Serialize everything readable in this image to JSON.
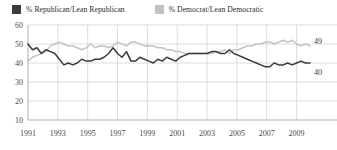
{
  "legend": {
    "position": "top-left",
    "entries": [
      {
        "label": "% Republican/Lean Republican",
        "color": "#3b3b3b",
        "swatch": "legend-swatch-republican"
      },
      {
        "label": "% Democrat/Lean Democratic",
        "color": "#c2c2c2",
        "swatch": "legend-swatch-democrat"
      }
    ]
  },
  "axes": {
    "y_ticks": [
      "60",
      "50",
      "40",
      "30",
      "20",
      "10"
    ],
    "x_ticks": [
      "1991",
      "1993",
      "1995",
      "1997",
      "1999",
      "2001",
      "2003",
      "2005",
      "2007",
      "2009"
    ]
  },
  "end_labels": {
    "democrat": "49",
    "republican": "40"
  },
  "colors": {
    "republican": "#3b3b3b",
    "democrat": "#c2c2c2",
    "grid": "#cfcfcf",
    "axis": "#b6b6b6",
    "background": "#ffffff",
    "text": "#2b2b2b"
  },
  "chart_data": {
    "type": "line",
    "title": "",
    "subtitle": "",
    "xlabel": "",
    "ylabel": "",
    "xlim": [
      1991,
      2009.9
    ],
    "ylim": [
      10,
      60
    ],
    "y_ticks": [
      60,
      50,
      40,
      30,
      20,
      10
    ],
    "x_ticks": [
      1991,
      1993,
      1995,
      1997,
      1999,
      2001,
      2003,
      2005,
      2007,
      2009
    ],
    "grid": true,
    "legend_position": "top-left",
    "annotations": [
      {
        "text": "49",
        "series": "% Democrat/Lean Democratic",
        "x": 2009.9,
        "y": 49
      },
      {
        "text": "40",
        "series": "% Republican/Lean Republican",
        "x": 2009.9,
        "y": 40
      }
    ],
    "x": [
      1991.0,
      1991.3,
      1991.6,
      1991.9,
      1992.2,
      1992.5,
      1992.8,
      1993.1,
      1993.4,
      1993.7,
      1994.0,
      1994.3,
      1994.6,
      1994.9,
      1995.2,
      1995.5,
      1995.8,
      1996.1,
      1996.4,
      1996.7,
      1997.0,
      1997.3,
      1997.6,
      1997.9,
      1998.2,
      1998.5,
      1998.8,
      1999.1,
      1999.4,
      1999.7,
      2000.0,
      2000.3,
      2000.6,
      2000.9,
      2001.2,
      2001.5,
      2001.8,
      2002.1,
      2002.4,
      2002.7,
      2003.0,
      2003.3,
      2003.6,
      2003.9,
      2004.2,
      2004.5,
      2004.8,
      2005.1,
      2005.4,
      2005.7,
      2006.0,
      2006.3,
      2006.6,
      2006.9,
      2007.2,
      2007.5,
      2007.8,
      2008.1,
      2008.4,
      2008.7,
      2009.0,
      2009.3,
      2009.6,
      2009.9
    ],
    "series": [
      {
        "name": "% Republican/Lean Republican",
        "color": "#3b3b3b",
        "values": [
          50,
          47,
          48,
          45,
          47,
          46,
          45,
          42,
          39,
          40,
          39,
          40,
          42,
          41,
          41,
          42,
          42,
          43,
          45,
          48,
          45,
          43,
          46,
          41,
          41,
          43,
          42,
          41,
          40,
          42,
          41,
          43,
          42,
          41,
          43,
          44,
          45,
          45,
          45,
          45,
          45,
          46,
          46,
          45,
          45,
          47,
          45,
          44,
          43,
          42,
          41,
          40,
          39,
          38,
          38,
          40,
          39,
          39,
          40,
          39,
          40,
          41,
          40,
          40
        ]
      },
      {
        "name": "% Democrat/Lean Democratic",
        "color": "#c2c2c2",
        "values": [
          41,
          43,
          44,
          45,
          46,
          49,
          50,
          51,
          50,
          49,
          49,
          48,
          47,
          48,
          50,
          48,
          49,
          49,
          48,
          49,
          51,
          50,
          49,
          51,
          51,
          50,
          49,
          49,
          49,
          48,
          48,
          47,
          47,
          46,
          46,
          45,
          45,
          45,
          45,
          45,
          45,
          45,
          46,
          46,
          47,
          45,
          47,
          47,
          48,
          49,
          49,
          50,
          50,
          51,
          51,
          50,
          51,
          52,
          51,
          52,
          50,
          49,
          50,
          49
        ]
      }
    ]
  }
}
